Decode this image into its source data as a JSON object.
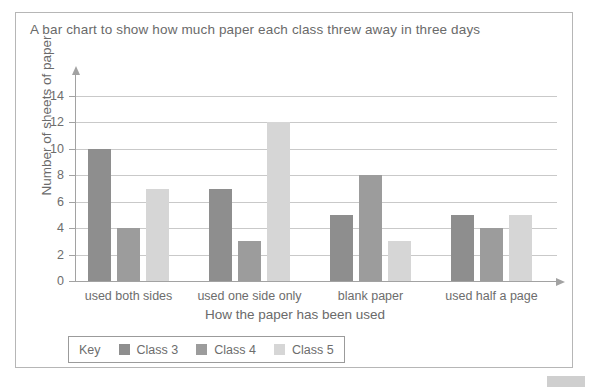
{
  "chart_data": {
    "type": "bar",
    "title": "A bar chart to show how much paper each class threw away in three days",
    "xlabel": "How the paper has been used",
    "ylabel": "Number of sheets of paper",
    "categories": [
      "used both sides",
      "used one side only",
      "blank paper",
      "used half a page"
    ],
    "series": [
      {
        "name": "Class 3",
        "color": "#8e8e8e",
        "values": [
          10,
          7,
          5,
          5
        ]
      },
      {
        "name": "Class 4",
        "color": "#9c9c9c",
        "values": [
          4,
          3,
          8,
          4
        ]
      },
      {
        "name": "Class 5",
        "color": "#d6d6d6",
        "values": [
          7,
          12,
          3,
          5
        ]
      }
    ],
    "ylim": [
      0,
      14
    ],
    "ytick_labels": [
      "0",
      "2",
      "4",
      "6",
      "8",
      "10",
      "12",
      "14"
    ],
    "ytick_values": [
      0,
      2,
      4,
      6,
      8,
      10,
      12,
      14
    ],
    "grid": true,
    "legend_position": "bottom-left",
    "legend_title": "Key",
    "gridline_color": "#c9c9c9",
    "axis_color": "#a2a2a2",
    "text_color": "#6d6d6d"
  }
}
